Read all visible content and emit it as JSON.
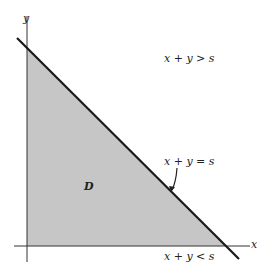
{
  "diagram": {
    "axes": {
      "x_label": "x",
      "y_label": "y"
    },
    "region_label": "D",
    "annotations": {
      "above_line": "x + y > s",
      "on_line": "x + y = s",
      "below_line": "x + y < s"
    },
    "colors": {
      "region_fill": "#c6c6c6",
      "line": "#1a1a1a",
      "axis": "#333333"
    }
  }
}
